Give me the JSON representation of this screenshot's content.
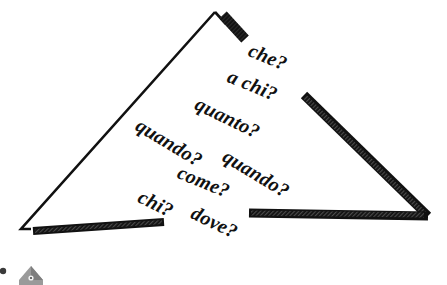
{
  "figure": {
    "title": "",
    "type": "hand-drawn-triangle-diagram",
    "colors": {
      "ink": "#111111",
      "background": "#ffffff",
      "icon_gray": "#8a8a8a",
      "icon_gray_dark": "#6e6e6e"
    },
    "triangle": {
      "apex": [
        215,
        12
      ],
      "bottom_left": [
        21,
        229
      ],
      "bottom_right": [
        427,
        215
      ],
      "thin_edge_label": "left-edge",
      "thick_edges": [
        "apex-stub",
        "right-edge",
        "bottom-right-segment",
        "bottom-left-segment"
      ]
    },
    "questions": [
      {
        "text": "che?",
        "x": 249,
        "y": 53,
        "rotate": 22,
        "size": 20
      },
      {
        "text": "a chi?",
        "x": 228,
        "y": 79,
        "rotate": 22,
        "size": 20
      },
      {
        "text": "quanto?",
        "x": 196,
        "y": 106,
        "rotate": 26,
        "size": 20
      },
      {
        "text": "quando?",
        "x": 137,
        "y": 127,
        "rotate": 31,
        "size": 20
      },
      {
        "text": "quando?",
        "x": 224,
        "y": 158,
        "rotate": 31,
        "size": 20
      },
      {
        "text": "come?",
        "x": 178,
        "y": 175,
        "rotate": 22,
        "size": 20
      },
      {
        "text": "chi?",
        "x": 139,
        "y": 199,
        "rotate": 26,
        "size": 20
      },
      {
        "text": "dove?",
        "x": 192,
        "y": 215,
        "rotate": 26,
        "size": 20
      }
    ],
    "corner_icon": {
      "name": "house-icon",
      "x": 6,
      "y": 262,
      "width": 40,
      "height": 23
    }
  }
}
